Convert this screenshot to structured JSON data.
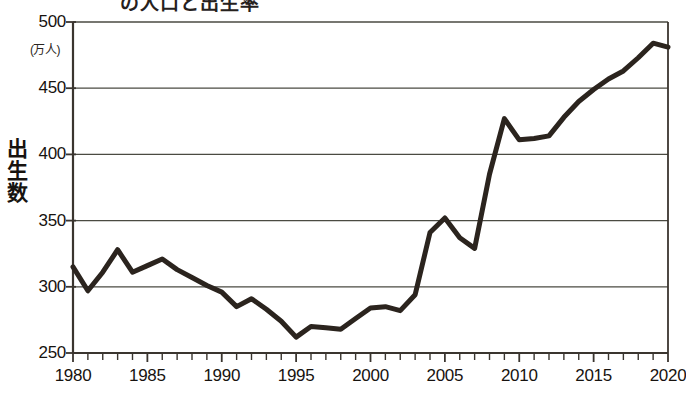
{
  "figure": {
    "title_partial": "の人口と出生率",
    "unit_label": "(万人)",
    "y_axis_title": "出生数"
  },
  "chart_data": {
    "type": "line",
    "title": "",
    "xlabel": "",
    "ylabel": "出生数",
    "unit": "万人",
    "xlim": [
      1980,
      2020
    ],
    "ylim": [
      250,
      500
    ],
    "ytick_labels": [
      "500",
      "450",
      "400",
      "350",
      "300",
      "250"
    ],
    "yticks": [
      500,
      450,
      400,
      350,
      300,
      250
    ],
    "xtick_labels": [
      "1980",
      "1985",
      "1990",
      "1995",
      "2000",
      "2005",
      "2010",
      "2015",
      "2020"
    ],
    "xticks": [
      1980,
      1985,
      1990,
      1995,
      2000,
      2005,
      2010,
      2015,
      2020
    ],
    "minor_xtick_interval": 1,
    "grid": "horizontal",
    "legend": "none",
    "line_color": "#2b241e",
    "line_width_px": 5,
    "x": [
      1980,
      1981,
      1982,
      1983,
      1984,
      1985,
      1986,
      1987,
      1988,
      1989,
      1990,
      1991,
      1992,
      1993,
      1994,
      1995,
      1996,
      1997,
      1998,
      1999,
      2000,
      2001,
      2002,
      2003,
      2004,
      2005,
      2006,
      2007,
      2008,
      2009,
      2010,
      2011,
      2012,
      2013,
      2014,
      2015,
      2016,
      2017,
      2018,
      2019,
      2020
    ],
    "values": [
      315,
      297,
      311,
      328,
      311,
      316,
      321,
      313,
      307,
      301,
      296,
      285,
      291,
      283,
      274,
      262,
      270,
      269,
      268,
      276,
      284,
      285,
      282,
      294,
      341,
      352,
      337,
      329,
      385,
      427,
      411,
      412,
      414,
      428,
      440,
      449,
      457,
      463,
      473,
      484,
      481
    ],
    "annotations": []
  }
}
